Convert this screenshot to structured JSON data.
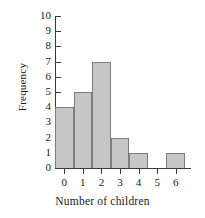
{
  "chart_data": {
    "type": "bar",
    "title": "",
    "xlabel": "Number of children",
    "ylabel": "Frequency",
    "categories": [
      "0",
      "1",
      "2",
      "3",
      "4",
      "5",
      "6"
    ],
    "values": [
      4,
      5,
      7,
      2,
      1,
      0,
      1
    ],
    "xlim": [
      -0.5,
      6.5
    ],
    "ylim": [
      0,
      10
    ],
    "ytick_labels": [
      "0",
      "1",
      "2",
      "3",
      "4",
      "5",
      "6",
      "7",
      "8",
      "9",
      "10"
    ],
    "xtick_labels": [
      "0",
      "1",
      "2",
      "3",
      "4",
      "5",
      "6"
    ],
    "grid": false,
    "legend": null,
    "bar_fill_color": "#c6c6c6",
    "bar_edge_color": "#7d7d7d",
    "axis_color": "#3a3a3a",
    "background_color": "#ffffff"
  }
}
